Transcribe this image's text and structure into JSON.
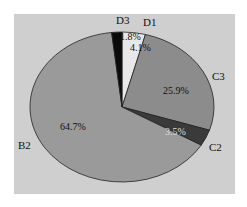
{
  "chart_data": {
    "type": "pie",
    "title": "",
    "start_angle": "12 o'clock",
    "direction": "clockwise",
    "categories": [
      "D1",
      "C3",
      "C2",
      "B2",
      "D3"
    ],
    "values": [
      4.1,
      25.9,
      3.5,
      64.7,
      1.8
    ],
    "value_labels": [
      "4.1%",
      "25.9%",
      "3.5%",
      "64.7%",
      "1.8%"
    ],
    "colors": {
      "D1": "#e8e8e8",
      "C3": "#8c8c8c",
      "C2": "#3a3a3a",
      "B2": "#9a9a9a",
      "D3": "#0a0a0a"
    },
    "background": "#cfcfcf",
    "legend": "none (category labels placed outside slices)"
  },
  "labels": {
    "D3": "D3",
    "D1": "D1",
    "C3": "C3",
    "C2": "C2",
    "B2": "B2",
    "D3_pct": "1.8%",
    "D1_pct": "4.1%",
    "C3_pct": "25.9%",
    "C2_pct": "3.5%",
    "B2_pct": "64.7%"
  }
}
